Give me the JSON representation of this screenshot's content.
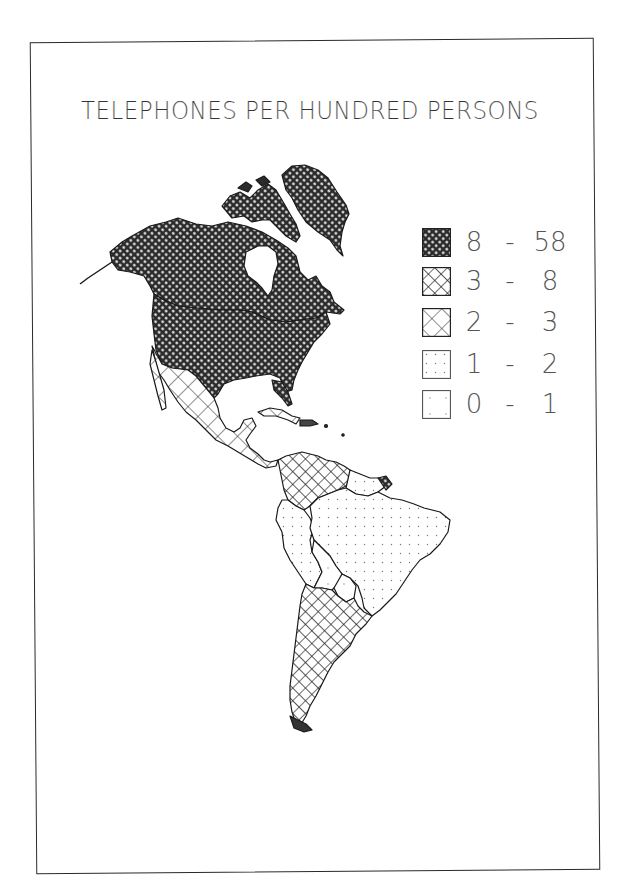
{
  "title": "TELEPHONES PER HUNDRED PERSONS",
  "legend": {
    "items": [
      {
        "low": "8",
        "dash": "-",
        "high": "58",
        "pattern": "dense-crosshatch"
      },
      {
        "low": "3",
        "dash": "-",
        "high": "8",
        "pattern": "medium-crosshatch"
      },
      {
        "low": "2",
        "dash": "-",
        "high": "3",
        "pattern": "sparse-crosshatch"
      },
      {
        "low": "1",
        "dash": "-",
        "high": "2",
        "pattern": "dots"
      },
      {
        "low": "0",
        "dash": "-",
        "high": "1",
        "pattern": "sparse-dots"
      }
    ]
  },
  "map": {
    "region": "Americas",
    "classes": {
      "8-58": [
        "United States",
        "Canada",
        "Alaska",
        "Greenland",
        "Canadian Arctic Archipelago",
        "French Guiana"
      ],
      "3-8": [
        "Argentina",
        "Chile",
        "Uruguay",
        "Venezuela",
        "Colombia"
      ],
      "2-3": [
        "Mexico",
        "Central America",
        "Cuba"
      ],
      "1-2": [
        "Brazil",
        "Peru",
        "Ecuador",
        "Guyana",
        "Suriname"
      ],
      "0-1": [
        "Bolivia",
        "Paraguay"
      ]
    }
  },
  "colors": {
    "ink": "#1a1a1a",
    "paper": "#ffffff",
    "frame": "#2a2a2a"
  }
}
